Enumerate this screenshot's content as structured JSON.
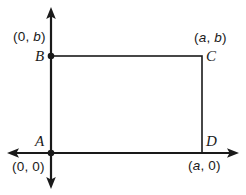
{
  "figure": {
    "width": 246,
    "height": 195,
    "stroke_color": "#1a1a1a",
    "background_color": "#ffffff"
  },
  "axes": {
    "origin": {
      "x": 51,
      "y": 153
    },
    "y_axis": {
      "top_y": 8,
      "bottom_y": 188,
      "arrow_both_ends": true
    },
    "x_axis": {
      "left_x": 8,
      "right_x": 238,
      "arrow_both_ends": true
    }
  },
  "rectangle": {
    "left": 51,
    "top": 56,
    "right": 202,
    "bottom": 153
  },
  "points": [
    {
      "vertex": "A",
      "coord": "(0, 0)",
      "coord_parts": {
        "open": "(",
        "x": "0",
        "sep": ", ",
        "y": "0",
        "close": ")"
      },
      "x_italic": false,
      "y_italic": false,
      "has_dot": true,
      "px": 51,
      "py": 153
    },
    {
      "vertex": "B",
      "coord": "(0, b)",
      "coord_parts": {
        "open": "(",
        "x": "0",
        "sep": ", ",
        "y": "b",
        "close": ")"
      },
      "x_italic": false,
      "y_italic": true,
      "has_dot": true,
      "px": 51,
      "py": 56
    },
    {
      "vertex": "C",
      "coord": "(a, b)",
      "coord_parts": {
        "open": "(",
        "x": "a",
        "sep": ", ",
        "y": "b",
        "close": ")"
      },
      "x_italic": true,
      "y_italic": true,
      "has_dot": false,
      "px": 202,
      "py": 56
    },
    {
      "vertex": "D",
      "coord": "(a, 0)",
      "coord_parts": {
        "open": "(",
        "x": "a",
        "sep": ", ",
        "y": "0",
        "close": ")"
      },
      "x_italic": true,
      "y_italic": false,
      "has_dot": false,
      "px": 202,
      "py": 153
    }
  ]
}
